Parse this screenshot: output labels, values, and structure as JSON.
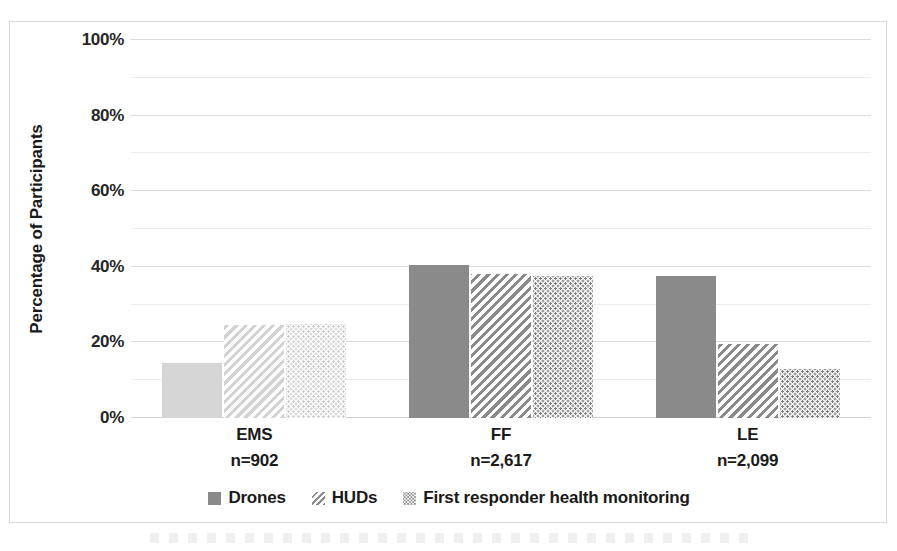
{
  "chart_data": {
    "type": "bar",
    "title": "",
    "xlabel": "",
    "ylabel": "Percentage of Participants",
    "ylim": [
      0,
      100
    ],
    "ytick_labels": [
      "0%",
      "20%",
      "40%",
      "60%",
      "80%",
      "100%"
    ],
    "ytick_values": [
      0,
      20,
      40,
      60,
      80,
      100
    ],
    "minor_gridlines": [
      10,
      30,
      50,
      70,
      90
    ],
    "grid": true,
    "legend_position": "bottom",
    "categories": [
      "EMS",
      "FF",
      "LE"
    ],
    "category_sublabels": [
      "n=902",
      "n=2,617",
      "n=2,099"
    ],
    "series": [
      {
        "name": "Drones",
        "pattern": "solid",
        "values": [
          14.5,
          40.5,
          37.5
        ]
      },
      {
        "name": "HUDs",
        "pattern": "diagonal-hatch",
        "values": [
          24.5,
          38.0,
          19.5
        ]
      },
      {
        "name": "First responder health monitoring",
        "pattern": "dotted",
        "values": [
          25.0,
          37.5,
          13.0
        ]
      }
    ]
  },
  "axis": {
    "y_title": "Percentage of Participants",
    "ticks": [
      {
        "label": "100%",
        "value": 100
      },
      {
        "label": "80%",
        "value": 80
      },
      {
        "label": "60%",
        "value": 60
      },
      {
        "label": "40%",
        "value": 40
      },
      {
        "label": "20%",
        "value": 20
      },
      {
        "label": "0%",
        "value": 0
      }
    ]
  },
  "groups": [
    {
      "category": "EMS",
      "sublabel": "n=902",
      "values": [
        14.5,
        24.5,
        25.0
      ],
      "faded": true
    },
    {
      "category": "FF",
      "sublabel": "n=2,617",
      "values": [
        40.5,
        38.0,
        37.5
      ],
      "faded": false
    },
    {
      "category": "LE",
      "sublabel": "n=2,099",
      "values": [
        37.5,
        19.5,
        13.0
      ],
      "faded": false
    }
  ],
  "legend": {
    "items": [
      {
        "label": "Drones",
        "swatch": "solid-swatch-icon",
        "pattern": "fill-solid"
      },
      {
        "label": "HUDs",
        "swatch": "hatch-swatch-icon",
        "pattern": "fill-hatch"
      },
      {
        "label": "First responder health monitoring",
        "swatch": "dots-swatch-icon",
        "pattern": "fill-dots"
      }
    ]
  },
  "colors": {
    "bar_dark": "#8a8a8a",
    "bar_faded": "#d5d5d5",
    "gridline": "#e2e2e2",
    "frame_border": "#d8d8d8",
    "text": "#1a1a1a"
  }
}
